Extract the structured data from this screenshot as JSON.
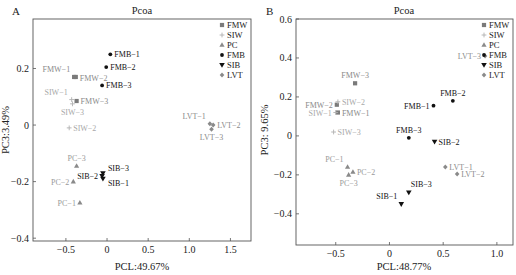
{
  "groups": {
    "FMW": {
      "color": "#7a7a7a",
      "marker": "square",
      "label_color": "#8a8a8a"
    },
    "SIW": {
      "color": "#b0b0b0",
      "marker": "plus",
      "label_color": "#a8a8a8"
    },
    "PC": {
      "color": "#8a8a8a",
      "marker": "triangle-up",
      "label_color": "#9a9a9a"
    },
    "FMB": {
      "color": "#111111",
      "marker": "dot",
      "label_color": "#111111"
    },
    "SIB": {
      "color": "#111111",
      "marker": "triangle-down",
      "label_color": "#111111"
    },
    "LVT": {
      "color": "#8a8a8a",
      "marker": "diamond",
      "label_color": "#8a8a8a"
    }
  },
  "chart_data": [
    {
      "type": "scatter",
      "panel": "A",
      "title": "Pcoa",
      "xlabel": "PCL:49.67%",
      "ylabel": "PC3:3.49%",
      "xlim": [
        -0.9,
        1.75
      ],
      "ylim": [
        -0.41,
        0.375
      ],
      "xticks": [
        -0.5,
        0,
        0.5,
        1.0,
        1.5
      ],
      "xtick_labels": [
        "−0.5",
        "0",
        "0.5",
        "1.0",
        "1.5"
      ],
      "yticks": [
        -0.4,
        -0.2,
        0,
        0.2
      ],
      "ytick_labels": [
        "−0.4",
        "−0.2",
        "0",
        "0.2"
      ],
      "legend": [
        "FMW",
        "SIW",
        "PC",
        "FMB",
        "SIB",
        "LVT"
      ],
      "legend_position": "top-right",
      "grid": false,
      "points": [
        {
          "label": "FMW-1",
          "group": "FMW",
          "x": -0.4,
          "y": 0.17,
          "label_pos": "above-left"
        },
        {
          "label": "FMW-2",
          "group": "FMW",
          "x": -0.38,
          "y": 0.17,
          "label_pos": "right-low"
        },
        {
          "label": "FMW-3",
          "group": "FMW",
          "x": -0.37,
          "y": 0.085,
          "label_pos": "right"
        },
        {
          "label": "SIW-1",
          "group": "SIW",
          "x": -0.43,
          "y": 0.09,
          "label_pos": "above-left"
        },
        {
          "label": "SIW-3",
          "group": "SIW",
          "x": -0.42,
          "y": 0.075,
          "label_pos": "below"
        },
        {
          "label": "SIW-2",
          "group": "SIW",
          "x": -0.46,
          "y": -0.01,
          "label_pos": "right"
        },
        {
          "label": "FMB-1",
          "group": "FMB",
          "x": 0.04,
          "y": 0.25,
          "label_pos": "right"
        },
        {
          "label": "FMB-2",
          "group": "FMB",
          "x": -0.01,
          "y": 0.205,
          "label_pos": "right"
        },
        {
          "label": "FMB-3",
          "group": "FMB",
          "x": -0.06,
          "y": 0.14,
          "label_pos": "right"
        },
        {
          "label": "PC-3",
          "group": "PC",
          "x": -0.37,
          "y": -0.145,
          "label_pos": "above"
        },
        {
          "label": "PC-2",
          "group": "PC",
          "x": -0.41,
          "y": -0.2,
          "label_pos": "left"
        },
        {
          "label": "PC-1",
          "group": "PC",
          "x": -0.33,
          "y": -0.275,
          "label_pos": "left"
        },
        {
          "label": "SIB-3",
          "group": "SIB",
          "x": -0.05,
          "y": -0.17,
          "label_pos": "right-up"
        },
        {
          "label": "SIB-2",
          "group": "SIB",
          "x": -0.06,
          "y": -0.18,
          "label_pos": "left"
        },
        {
          "label": "SIB-1",
          "group": "SIB",
          "x": -0.05,
          "y": -0.19,
          "label_pos": "right-down"
        },
        {
          "label": "LVT-1",
          "group": "LVT",
          "x": 1.25,
          "y": 0.005,
          "label_pos": "above-left"
        },
        {
          "label": "LVT-2",
          "group": "LVT",
          "x": 1.29,
          "y": 0.0,
          "label_pos": "right"
        },
        {
          "label": "LVT-3",
          "group": "LVT",
          "x": 1.27,
          "y": -0.015,
          "label_pos": "below"
        }
      ]
    },
    {
      "type": "scatter",
      "panel": "B",
      "title": "Pcoa",
      "xlabel": "PCL:48.77%",
      "ylabel": "PC3: 9.65%",
      "xlim": [
        -0.87,
        1.15
      ],
      "ylim": [
        -0.56,
        0.6
      ],
      "xticks": [
        -0.5,
        0,
        0.5,
        1.0
      ],
      "xtick_labels": [
        "−0.5",
        "0",
        "0.5",
        "1.0"
      ],
      "yticks": [
        -0.4,
        -0.2,
        0,
        0.2,
        0.4,
        0.6
      ],
      "ytick_labels": [
        "−0.4",
        "−0.2",
        "0",
        "0.2",
        "0.4",
        "0.6"
      ],
      "legend": [
        "FMW",
        "SIW",
        "PC",
        "FMB",
        "SIB",
        "LVT"
      ],
      "legend_position": "top-right",
      "grid": false,
      "points": [
        {
          "label": "FMW-3",
          "group": "FMW",
          "x": -0.32,
          "y": 0.27,
          "label_pos": "above"
        },
        {
          "label": "FMW-2",
          "group": "FMW",
          "x": -0.49,
          "y": 0.16,
          "label_pos": "left"
        },
        {
          "label": "FMW-1",
          "group": "FMW",
          "x": -0.48,
          "y": 0.12,
          "label_pos": "right"
        },
        {
          "label": "SIW-2",
          "group": "SIW",
          "x": -0.48,
          "y": 0.175,
          "label_pos": "right"
        },
        {
          "label": "SIW-1",
          "group": "SIW",
          "x": -0.5,
          "y": 0.12,
          "label_pos": "left"
        },
        {
          "label": "SIW-3",
          "group": "SIW",
          "x": -0.52,
          "y": 0.02,
          "label_pos": "right"
        },
        {
          "label": "FMB-1",
          "group": "FMB",
          "x": 0.41,
          "y": 0.155,
          "label_pos": "left"
        },
        {
          "label": "FMB-2",
          "group": "FMB",
          "x": 0.59,
          "y": 0.18,
          "label_pos": "above"
        },
        {
          "label": "FMB-3",
          "group": "FMB",
          "x": 0.18,
          "y": -0.01,
          "label_pos": "above"
        },
        {
          "label": "LVT-3",
          "group": "LVT",
          "x": 0.89,
          "y": 0.41,
          "label_pos": "left"
        },
        {
          "label": "LVT-1",
          "group": "LVT",
          "x": 0.52,
          "y": -0.16,
          "label_pos": "right"
        },
        {
          "label": "LVT-2",
          "group": "LVT",
          "x": 0.63,
          "y": -0.195,
          "label_pos": "right"
        },
        {
          "label": "PC-1",
          "group": "PC",
          "x": -0.39,
          "y": -0.16,
          "label_pos": "above-left"
        },
        {
          "label": "PC-2",
          "group": "PC",
          "x": -0.34,
          "y": -0.185,
          "label_pos": "right"
        },
        {
          "label": "PC-3",
          "group": "PC",
          "x": -0.38,
          "y": -0.2,
          "label_pos": "below"
        },
        {
          "label": "SIB-2",
          "group": "SIB",
          "x": 0.42,
          "y": -0.03,
          "label_pos": "right"
        },
        {
          "label": "SIB-3",
          "group": "SIB",
          "x": 0.18,
          "y": -0.29,
          "label_pos": "above-right"
        },
        {
          "label": "SIB-1",
          "group": "SIB",
          "x": 0.11,
          "y": -0.35,
          "label_pos": "above-left"
        }
      ]
    }
  ]
}
